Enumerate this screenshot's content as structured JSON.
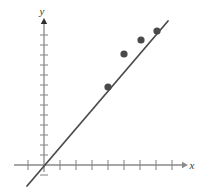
{
  "chart_data": {
    "type": "scatter",
    "title": "",
    "subtitle": "",
    "xlabel": "x",
    "ylabel": "y",
    "grid": false,
    "legend": false,
    "legend_position": "none",
    "axis_style": "arrowed-number-line",
    "tick_labels_x": [],
    "tick_labels_y": [],
    "x_tick_count": 10,
    "y_tick_count": 14,
    "xlim": [
      -1,
      11
    ],
    "ylim": [
      -1,
      15
    ],
    "series": [
      {
        "name": "data points",
        "type": "scatter",
        "color": "#4a4a4a",
        "marker": "circle",
        "x": [
          4,
          5,
          6,
          7
        ],
        "y": [
          7,
          10,
          12,
          13
        ],
        "points_px": [
          {
            "x": 108,
            "y": 87
          },
          {
            "x": 124,
            "y": 54
          },
          {
            "x": 141,
            "y": 40
          },
          {
            "x": 157,
            "y": 31
          }
        ]
      },
      {
        "name": "line of best fit",
        "type": "line",
        "color": "#4a4a4a",
        "x_start": -0.5,
        "y_start": -1.2,
        "x_end": 7.7,
        "y_end": 13.8,
        "line_px": {
          "x1": 27,
          "y1": 186,
          "x2": 168,
          "y2": 21
        }
      }
    ],
    "annotations": []
  },
  "axes": {
    "x_axis": {
      "label": "x",
      "arrow": true,
      "origin_px": {
        "x": 44,
        "y": 165
      },
      "start_px": 14,
      "end_px": 182,
      "tick_spacing_px": 16,
      "tick_half_len_px": 5
    },
    "y_axis": {
      "label": "y",
      "arrow": true,
      "origin_px": {
        "x": 44,
        "y": 165
      },
      "start_px": 172,
      "end_px": 24,
      "tick_spacing_px": 10,
      "tick_half_len_px": 4
    }
  },
  "colors": {
    "axis": "#8a8a8a",
    "tick": "#8a8a8a",
    "line": "#4a4a4a",
    "point": "#4a4a4a",
    "label": "#3a3a3a",
    "background": "#ffffff"
  }
}
